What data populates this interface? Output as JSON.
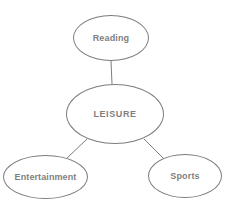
{
  "caption": {
    "text": "late 1800s."
  },
  "diagram": {
    "type": "mind-map",
    "center_node": {
      "id": "leisure",
      "label": "LEISURE",
      "x": 115,
      "y": 114,
      "rx": 49,
      "ry": 30
    },
    "branch_nodes": [
      {
        "id": "reading",
        "label": "Reading",
        "x": 111,
        "y": 38,
        "rx": 38,
        "ry": 23
      },
      {
        "id": "entertainment",
        "label": "Entertainment",
        "x": 45,
        "y": 177,
        "rx": 42,
        "ry": 22
      },
      {
        "id": "sports",
        "label": "Sports",
        "x": 185,
        "y": 176,
        "rx": 37,
        "ry": 22
      }
    ],
    "edges": [
      {
        "from": "leisure",
        "to": "reading",
        "x1": 112,
        "y1": 84,
        "x2": 111,
        "y2": 61
      },
      {
        "from": "leisure",
        "to": "entertainment",
        "x1": 87,
        "y1": 139,
        "x2": 66,
        "y2": 159
      },
      {
        "from": "leisure",
        "to": "sports",
        "x1": 144,
        "y1": 139,
        "x2": 163,
        "y2": 158
      }
    ],
    "colors": {
      "stroke": "#7d7d80",
      "text": "#7f7f7f",
      "background": "#ffffff"
    }
  }
}
